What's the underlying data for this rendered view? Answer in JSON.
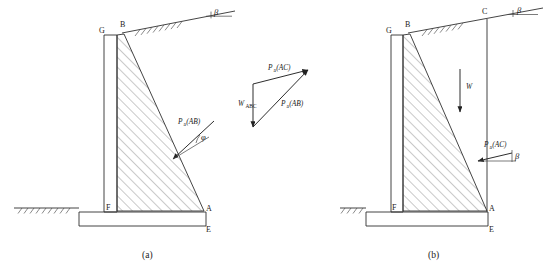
{
  "figure": {
    "title": "",
    "type": "engineering-diagram",
    "background_color": "#ffffff",
    "line_color": "#303030"
  },
  "panels": [
    {
      "id": "a",
      "caption": "(a)",
      "points": [
        {
          "label": "G",
          "x": 103,
          "y": 33
        },
        {
          "label": "B",
          "x": 124,
          "y": 28
        },
        {
          "label": "F",
          "x": 106,
          "y": 212
        },
        {
          "label": "A",
          "x": 205,
          "y": 210
        },
        {
          "label": "E",
          "x": 205,
          "y": 227
        }
      ],
      "forces": [
        {
          "name": "Pa(AB)",
          "symbol": "P",
          "subscript": "a",
          "argument": "(AB)"
        }
      ],
      "angles": [
        {
          "label": "φ",
          "name": "phi",
          "at": "pressure-line"
        },
        {
          "label": "β",
          "name": "beta",
          "at": "backfill-slope"
        }
      ]
    },
    {
      "id": "b",
      "caption": "(b)",
      "points": [
        {
          "label": "G",
          "x": 390,
          "y": 33
        },
        {
          "label": "B",
          "x": 409,
          "y": 28
        },
        {
          "label": "C",
          "x": 479,
          "y": 13
        },
        {
          "label": "F",
          "x": 392,
          "y": 212
        },
        {
          "label": "A",
          "x": 487,
          "y": 210
        },
        {
          "label": "E",
          "x": 487,
          "y": 227
        }
      ],
      "forces": [
        {
          "name": "W",
          "symbol": "W",
          "subscript": "",
          "argument": ""
        },
        {
          "name": "Pa(AC)",
          "symbol": "P",
          "subscript": "a",
          "argument": "(AC)"
        }
      ],
      "angles": [
        {
          "label": "β",
          "name": "beta",
          "at": "backfill-slope"
        },
        {
          "label": "β",
          "name": "beta",
          "at": "pressure-line"
        }
      ]
    }
  ],
  "force_triangle": {
    "name": "force-polygon",
    "vectors": [
      {
        "symbol": "W",
        "subscript": "ABC",
        "argument": "",
        "label": "W_ABC",
        "direction": "vertical-down"
      },
      {
        "symbol": "P",
        "subscript": "a",
        "argument": "(AC)",
        "label": "Pa(AC)",
        "direction": "up-right"
      },
      {
        "symbol": "P",
        "subscript": "a",
        "argument": "(AB)",
        "label": "Pa(AB)",
        "direction": "up-right-diagonal"
      }
    ]
  },
  "labels": {
    "P": "P",
    "W": "W",
    "a": "a",
    "ABC": "ABC",
    "AB_paren": "(AB)",
    "AC_paren": "(AC)",
    "beta": "β",
    "phi": "φ",
    "G": "G",
    "B": "B",
    "C": "C",
    "F": "F",
    "A": "A",
    "E": "E",
    "caption_a": "(a)",
    "caption_b": "(b)"
  }
}
